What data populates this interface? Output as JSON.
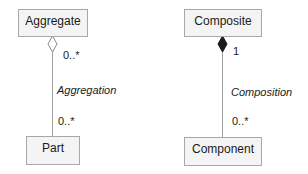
{
  "diagram": {
    "aggregation": {
      "whole_class": "Aggregate",
      "part_class": "Part",
      "relationship_label": "Aggregation",
      "whole_multiplicity": "0..*",
      "part_multiplicity": "0..*",
      "end_symbol": "hollow-diamond"
    },
    "composition": {
      "whole_class": "Composite",
      "part_class": "Component",
      "relationship_label": "Composition",
      "whole_multiplicity": "1",
      "part_multiplicity": "0..*",
      "end_symbol": "filled-diamond"
    },
    "colors": {
      "box_fill": "#f4f4f4",
      "box_border": "#a8a8a8",
      "line": "#a0a0a0",
      "filled_diamond": "#1a1a1a"
    }
  }
}
